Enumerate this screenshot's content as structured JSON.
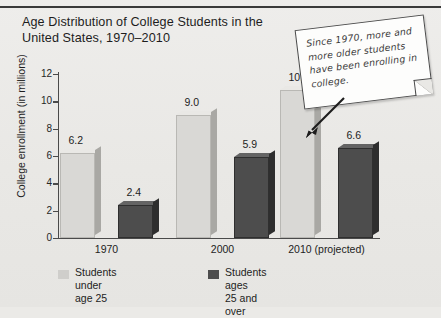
{
  "title": "Age Distribution of College Students in the United States, 1970–2010",
  "callout": {
    "text": "Since 1970, more and more older students have been enrolling in college."
  },
  "legend": {
    "items": [
      {
        "label": "Students under\nage 25",
        "color": "#cfcecb"
      },
      {
        "label": "Students ages\n25 and over",
        "color": "#4d4d4d"
      }
    ]
  },
  "chart_data": {
    "type": "bar",
    "title": "Age Distribution of College Students in the United States, 1970–2010",
    "xlabel": "",
    "ylabel": "College enrollment (in millions)",
    "categories": [
      "1970",
      "2000",
      "2010 (projected)"
    ],
    "ylim": [
      0,
      12
    ],
    "yticks": [
      "0",
      "2",
      "4",
      "6",
      "8",
      "10",
      "12"
    ],
    "grid": false,
    "legend_position": "bottom-left",
    "series": [
      {
        "name": "Students under age 25",
        "color": "#d9d8d5",
        "values": [
          6.2,
          9.0,
          10.8
        ],
        "labels": [
          "6.2",
          "9.0",
          "10.8"
        ]
      },
      {
        "name": "Students ages 25 and over",
        "color": "#4d4d4d",
        "values": [
          2.4,
          5.9,
          6.6
        ],
        "labels": [
          "2.4",
          "5.9",
          "6.6"
        ]
      }
    ]
  }
}
